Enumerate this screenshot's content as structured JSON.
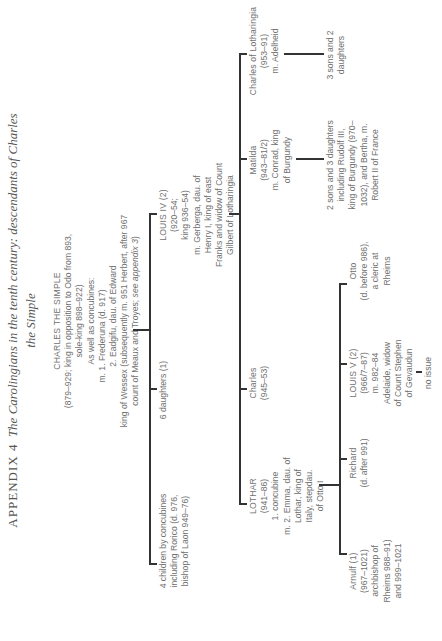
{
  "title": {
    "prefix": "APPENDIX 4",
    "line1": "The Carolingians in the tenth century: descendants of Charles",
    "line2": "the Simple"
  },
  "root": {
    "name": "CHARLES THE SIMPLE",
    "lines": [
      "(879–929; king in opposition to Odo from 893,",
      "sole-king 898–922)",
      "As well as concubines:",
      "m. 1. Frederuna (d. 917)",
      "2. Eadgifu, dau. of Edward",
      "king of Wessex (subsequently m. 951 Herbert, after 967",
      "count of Meaux and Troyes; "
    ],
    "see_ref": "see appendix 3",
    "see_close": ")"
  },
  "gen1": [
    {
      "lines": [
        "4 children by concubines",
        "including Rorico (d. 976,",
        "bishop of Laon 949–76)"
      ]
    },
    {
      "lines": [
        "6 daughters (1)"
      ]
    },
    {
      "name": "LOUIS IV (2)",
      "lines": [
        "(920–54;",
        "king 936–54)",
        "m. Gerberga, dau. of",
        "Henry I, king of east",
        "Franks and widow of Count",
        "Gilbert of Lotharingia"
      ]
    }
  ],
  "gen2": [
    {
      "name": "LOTHAR",
      "lines": [
        "(941–86)",
        "1. concubine",
        "m. 2. Emma, dau. of",
        "Lothar, king of",
        "Italy, stepdau.",
        "of Otto I"
      ]
    },
    {
      "name": "Charles",
      "lines": [
        "(945–53)"
      ]
    },
    {
      "name": "Matilda",
      "lines": [
        "(943–81/2)",
        "m. Conrad, king",
        "of Burgundy"
      ]
    },
    {
      "name": "Charles of Lotharingia",
      "lines": [
        "(953–91)",
        "m. Adelheid"
      ]
    }
  ],
  "gen3": [
    {
      "name": "Arnulf (1)",
      "lines": [
        "(967–1021)",
        "archbishop of",
        "Rheims 988–91)",
        "and 999–1021"
      ]
    },
    {
      "name": "Richard",
      "lines": [
        "(d. after 991)"
      ]
    },
    {
      "name": "LOUIS V (2)",
      "lines": [
        "(966/7–87)",
        "m. 982–84",
        "Adelaide, widow",
        "of Count Stephen",
        "of Gevaudun"
      ]
    },
    {
      "name": "Otto",
      "lines": [
        "(d. before 986),",
        "a cleric at",
        "Rheims"
      ]
    }
  ],
  "issue": {
    "louis_v": "no issue",
    "matilda": [
      "2 sons and 3 daughters",
      "including Rudolf III,",
      "king of Burgundy (970–",
      "1032), and Bertha, m.",
      "Robert II of France"
    ],
    "charles_lotharingia": [
      "3 sons and 2",
      "daughters"
    ]
  }
}
